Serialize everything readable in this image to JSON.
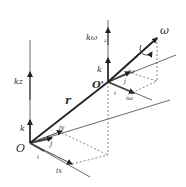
{
  "diagram": {
    "type": "vector-decomposition-3d",
    "labels": {
      "origin": "O",
      "origin_prime": "O'",
      "position_vector": "r",
      "omega": "ω",
      "k_omega_z": "kω",
      "k_omega_z_sub": "z",
      "k_left": "k",
      "k_right": "k",
      "kz": "kz",
      "i_left": "i",
      "j_left": "j",
      "ix": "ix",
      "jy": "jy",
      "i_right": "i",
      "j_right": "j",
      "i_omega": "iω",
      "j_omega": "jω"
    },
    "colors": {
      "stroke": "#333333",
      "axis": "#555555",
      "dashed": "#555555"
    }
  }
}
